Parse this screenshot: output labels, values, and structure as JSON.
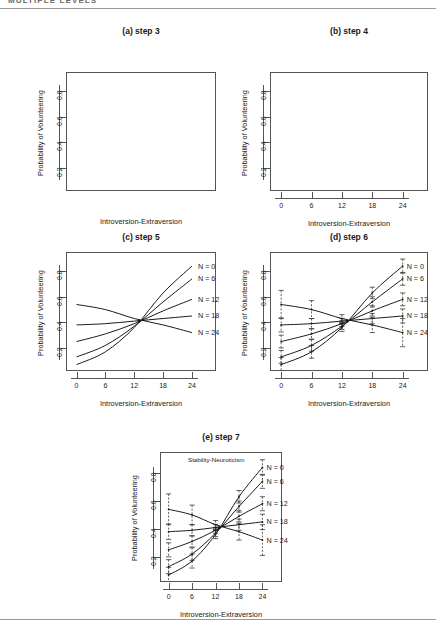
{
  "header": {
    "running_head": "MULTIPLE LEVELS"
  },
  "axes": {
    "xlabel": "Introversion-Extraversion",
    "ylabel": "Probability of Volunteering",
    "xticks": [
      "0",
      "6",
      "12",
      "18",
      "24"
    ],
    "xtick_values": [
      0,
      6,
      12,
      18,
      24
    ],
    "yticks": [
      "0.2",
      "0.4",
      "0.6",
      "0.8"
    ],
    "ytick_values": [
      0.2,
      0.4,
      0.6,
      0.8
    ],
    "xlim": [
      -2.2,
      29.0
    ],
    "ylim": [
      0.02,
      0.95
    ]
  },
  "legend": {
    "labels": [
      "N =  0",
      "N =  6",
      "N =  12",
      "N =  18",
      "N =  24"
    ],
    "n_values": [
      0,
      6,
      12,
      18,
      24
    ]
  },
  "annotations": {
    "moderator_label": "Stability-Neuroticism"
  },
  "panels": [
    {
      "id": "a",
      "title": "(a) step 3",
      "show_xticks": false,
      "show_yticks": true,
      "show_curves": false,
      "show_errorbars": false,
      "show_legend": false,
      "show_annotation": false
    },
    {
      "id": "b",
      "title": "(b) step 4",
      "show_xticks": true,
      "show_yticks": true,
      "show_curves": false,
      "show_errorbars": false,
      "show_legend": false,
      "show_annotation": false
    },
    {
      "id": "c",
      "title": "(c) step 5",
      "show_xticks": true,
      "show_yticks": true,
      "show_curves": true,
      "show_errorbars": false,
      "show_legend": true,
      "show_annotation": false
    },
    {
      "id": "d",
      "title": "(d) step 6",
      "show_xticks": true,
      "show_yticks": true,
      "show_curves": true,
      "show_errorbars": true,
      "show_legend": true,
      "show_annotation": false
    },
    {
      "id": "e",
      "title": "(e) step 7",
      "show_xticks": true,
      "show_yticks": true,
      "show_curves": true,
      "show_errorbars": true,
      "show_legend": true,
      "show_annotation": true
    }
  ],
  "chart_data": {
    "type": "line",
    "xlabel": "Introversion-Extraversion",
    "ylabel": "Probability of Volunteering",
    "xlim": [
      -2.2,
      29.0
    ],
    "ylim": [
      0.02,
      0.95
    ],
    "xticks": [
      0,
      6,
      12,
      18,
      24
    ],
    "yticks": [
      0.2,
      0.4,
      0.6,
      0.8
    ],
    "grid": false,
    "legend_position": "right-inside",
    "crossover_point": {
      "x": 13.0,
      "y": 0.41
    },
    "x": [
      0,
      6,
      12,
      18,
      24
    ],
    "series": [
      {
        "name": "N =  0",
        "n": 0,
        "values": [
          0.07,
          0.17,
          0.36,
          0.63,
          0.84
        ],
        "errors": [
          0.055,
          0.05,
          0.03,
          0.045,
          0.055
        ]
      },
      {
        "name": "N =  6",
        "n": 6,
        "values": [
          0.13,
          0.22,
          0.37,
          0.56,
          0.74
        ],
        "errors": [
          0.05,
          0.045,
          0.025,
          0.04,
          0.05
        ]
      },
      {
        "name": "N =  12",
        "n": 12,
        "values": [
          0.25,
          0.31,
          0.39,
          0.49,
          0.58
        ],
        "errors": [
          0.05,
          0.04,
          0.022,
          0.04,
          0.05
        ]
      },
      {
        "name": "N =  18",
        "n": 18,
        "values": [
          0.38,
          0.39,
          0.41,
          0.43,
          0.45
        ],
        "errors": [
          0.055,
          0.04,
          0.022,
          0.04,
          0.055
        ]
      },
      {
        "name": "N =  24",
        "n": 24,
        "values": [
          0.54,
          0.5,
          0.43,
          0.38,
          0.32
        ],
        "errors": [
          0.11,
          0.07,
          0.03,
          0.06,
          0.11
        ]
      }
    ]
  }
}
